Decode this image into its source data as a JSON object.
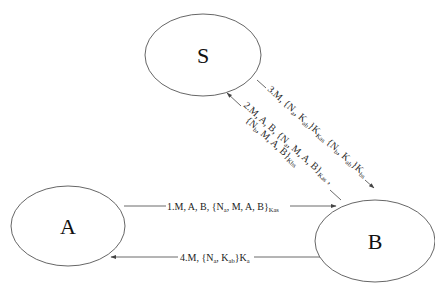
{
  "diagram": {
    "type": "protocol-message-flow",
    "nodes": [
      {
        "id": "S",
        "label": "S"
      },
      {
        "id": "A",
        "label": "A"
      },
      {
        "id": "B",
        "label": "B"
      }
    ],
    "messages": [
      {
        "step": "1",
        "from": "A",
        "to": "B",
        "text": "1.M, A, B, {Nₐ, M, A, B}",
        "parts": {
          "prefix": "1.M, A, B, {N",
          "n_sub": "a",
          "mid": ", M, A, B}",
          "key_sub": "Kas"
        }
      },
      {
        "step": "2",
        "from": "B",
        "to": "S",
        "line1": {
          "prefix": "2.M, A, B, {N",
          "n_sub": "a",
          "mid": ", M, A, B}",
          "key_sub": "Kas",
          "suffix": " ,"
        },
        "line2": {
          "prefix": "{N",
          "n_sub": "b",
          "mid": ", M, A, B}",
          "key_sub": "Kbs"
        }
      },
      {
        "step": "3",
        "from": "S",
        "to": "B",
        "part1": {
          "prefix": "3.M, {N",
          "n_sub": "a",
          "mid": ", K",
          "k_sub": "ab",
          "close": "}K",
          "key_sub": "Kas"
        },
        "part2": {
          "prefix": " {N",
          "n_sub": "b",
          "mid": ", K",
          "k_sub": "ab",
          "close": "}K",
          "key_sub": "bs"
        }
      },
      {
        "step": "4",
        "from": "B",
        "to": "A",
        "parts": {
          "prefix": "4.M, {N",
          "n_sub": "a",
          "mid": ", K",
          "k_sub": "ab",
          "close": "}K",
          "key_sub": "a"
        }
      }
    ],
    "colors": {
      "stroke": "#555555",
      "text": "#111111",
      "background": "#ffffff"
    }
  }
}
